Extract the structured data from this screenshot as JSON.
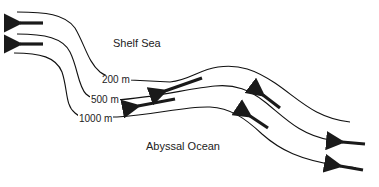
{
  "diagram": {
    "regions": {
      "shelf": "Shelf Sea",
      "abyssal": "Abyssal Ocean"
    },
    "contours": [
      {
        "label": "200 m",
        "depth_m": 200
      },
      {
        "label": "500 m",
        "depth_m": 500
      },
      {
        "label": "1000 m",
        "depth_m": 1000
      }
    ],
    "arrows": [
      {
        "location": "upper-left",
        "direction": "west"
      },
      {
        "location": "middle-left",
        "direction": "west"
      },
      {
        "location": "center-upper",
        "direction": "southwest"
      },
      {
        "location": "center-lower",
        "direction": "west-southwest"
      },
      {
        "location": "slope-upper",
        "direction": "northwest"
      },
      {
        "location": "slope-lower",
        "direction": "northwest"
      },
      {
        "location": "right-upper",
        "direction": "west"
      },
      {
        "location": "right-lower",
        "direction": "west"
      }
    ],
    "colors": {
      "line": "#111111",
      "arrow": "#1a1a1a",
      "text": "#222222",
      "background": "#ffffff"
    }
  }
}
